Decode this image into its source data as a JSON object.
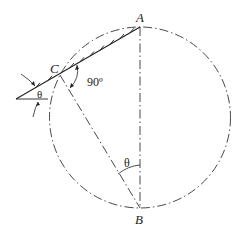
{
  "diagram": {
    "points": {
      "A": {
        "label": "A",
        "x": 140,
        "y": 27
      },
      "B": {
        "label": "B",
        "x": 140,
        "y": 208
      },
      "C": {
        "label": "C",
        "x": 60,
        "y": 75
      }
    },
    "circle": {
      "cx": 140,
      "cy": 117.5,
      "r": 90.5
    },
    "angles": {
      "right_angle_label": "90º",
      "theta_at_B": "θ",
      "theta_incline": "θ"
    },
    "colors": {
      "stroke": "#333333",
      "text": "#222222",
      "background": "#ffffff"
    }
  }
}
